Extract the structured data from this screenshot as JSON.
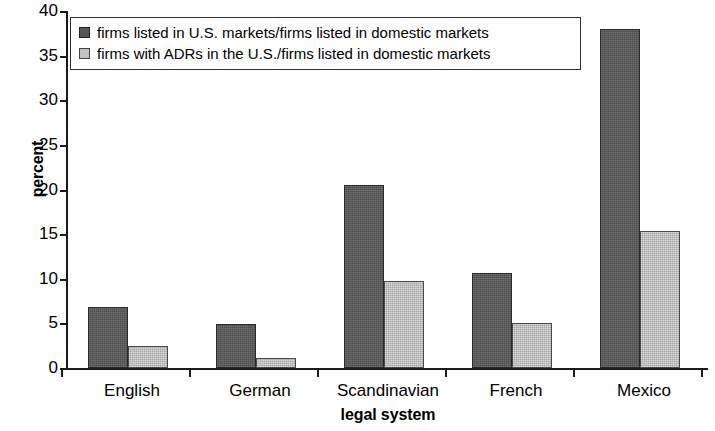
{
  "chart_data": {
    "type": "bar",
    "title": "",
    "xlabel": "legal system",
    "ylabel": "percent",
    "categories": [
      "English",
      "German",
      "Scandinavian",
      "French",
      "Mexico"
    ],
    "series": [
      {
        "name": "firms listed in U.S. markets/firms listed in domestic markets",
        "color": "#585858",
        "values": [
          6.8,
          4.9,
          20.5,
          10.7,
          38.0
        ]
      },
      {
        "name": "firms with ADRs in the U.S./firms listed in domestic markets",
        "color": "#c2c2c2",
        "values": [
          2.5,
          1.1,
          9.8,
          5.0,
          15.4
        ]
      }
    ],
    "ylim": [
      0,
      40
    ],
    "yticks": [
      "0",
      "5",
      "10",
      "15",
      "20",
      "25",
      "30",
      "35",
      "40"
    ],
    "ytick_values": [
      0,
      5,
      10,
      15,
      20,
      25,
      30,
      35,
      40
    ],
    "grid": false,
    "legend_position": "top-left"
  },
  "axes": {
    "y_title": "percent",
    "x_title": "legal system"
  }
}
